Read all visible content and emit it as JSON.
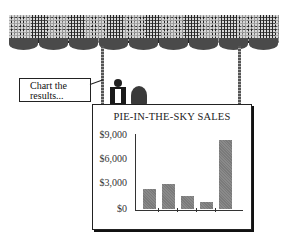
{
  "scene": {
    "speech_bubble": "Chart the results..."
  },
  "chart_data": {
    "type": "bar",
    "title": "PIE-IN-THE-SKY SALES",
    "xlabel": "",
    "ylabel": "",
    "categories": [
      "1",
      "2",
      "3",
      "4",
      "5"
    ],
    "values": [
      2400,
      3000,
      1500,
      800,
      8200
    ],
    "ylim": [
      0,
      9000
    ],
    "yticks": [
      "$0",
      "$3,000",
      "$6,000",
      "$9,000"
    ],
    "grid": false,
    "legend": null,
    "bar_color": "#808080"
  }
}
